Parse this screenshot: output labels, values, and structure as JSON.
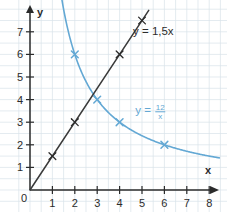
{
  "chart_data": {
    "type": "line",
    "title": "",
    "xlabel": "x",
    "ylabel": "y",
    "xlim": [
      0,
      8.6
    ],
    "ylim": [
      0,
      8.2
    ],
    "grid": true,
    "legend_position": "inline-annotations",
    "x_ticks": [
      "1",
      "2",
      "3",
      "4",
      "5",
      "6",
      "7",
      "8"
    ],
    "x_tick_values": [
      1,
      2,
      3,
      4,
      5,
      6,
      7,
      8
    ],
    "y_ticks": [
      "1",
      "2",
      "3",
      "4",
      "5",
      "6",
      "7"
    ],
    "y_tick_values": [
      1,
      2,
      3,
      4,
      5,
      6,
      7
    ],
    "origin_label": "0",
    "series": [
      {
        "name": "y = 1,5x",
        "label": "y = 1,5x",
        "color": "#2b2b2b",
        "kind": "line",
        "equation": "y = 1.5x",
        "marker": "x",
        "points": [
          {
            "x": 1,
            "y": 1.5
          },
          {
            "x": 2,
            "y": 3
          },
          {
            "x": 4,
            "y": 6
          },
          {
            "x": 5,
            "y": 7.5
          }
        ],
        "label_position": {
          "x": 4.6,
          "y": 6.85
        }
      },
      {
        "name": "y = 12/x",
        "label": "y =",
        "numerator": "12",
        "denominator": "x",
        "color": "#63a8d4",
        "kind": "hyperbola",
        "equation": "y = 12/x",
        "marker": "x",
        "points": [
          {
            "x": 2,
            "y": 6
          },
          {
            "x": 3,
            "y": 4
          },
          {
            "x": 4,
            "y": 3
          },
          {
            "x": 6,
            "y": 2
          }
        ],
        "label_position": {
          "x": 4.7,
          "y": 3.35
        }
      }
    ],
    "intersection": {
      "x": 2.83,
      "y": 4.24
    },
    "colors": {
      "axis": "#2b2b2b",
      "grid": "#d9e2ea",
      "linear": "#2b2b2b",
      "hyperbola": "#63a8d4",
      "background": "#ffffff"
    }
  }
}
